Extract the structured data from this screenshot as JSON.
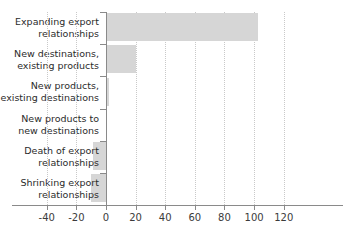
{
  "chart_data": {
    "type": "bar",
    "orientation": "horizontal",
    "title": "",
    "subtitle": "",
    "xlabel": "",
    "ylabel": "",
    "categories": [
      "Expanding export\nrelationships",
      "New destinations,\nexisting products",
      "New products,\nexisting destinations",
      "New products to\nnew destinations",
      "Death of export\nrelationships",
      "Shrinking export\nrelationships"
    ],
    "values": [
      102.5,
      20,
      2,
      0,
      -8.5,
      -10
    ],
    "xlim": [
      -40,
      120
    ],
    "xticks": [
      -40,
      -20,
      0,
      20,
      40,
      60,
      80,
      100,
      120
    ],
    "xtick_labels": [
      "-40",
      "-20",
      "0",
      "20",
      "40",
      "60",
      "80",
      "100",
      "120"
    ],
    "grid": "vertical-dotted",
    "legend": "none",
    "bar_color": "#d6d6d6",
    "axis_color": "#8a8a8a",
    "grid_color": "#c9c9c9"
  }
}
